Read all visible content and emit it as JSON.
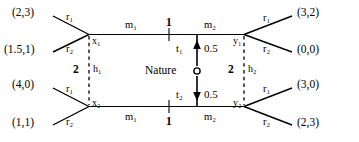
{
  "diagram": {
    "kind": "extensive-form-game-tree",
    "title": "",
    "nature_label": "Nature",
    "players": {
      "player1_label": "1",
      "player2_label": "2"
    },
    "nodes": [
      {
        "id": "x1",
        "label": "x₁",
        "x": 90,
        "y": 39
      },
      {
        "id": "x2",
        "label": "x₂",
        "x": 90,
        "y": 101
      },
      {
        "id": "y1",
        "label": "y₁",
        "x": 243,
        "y": 39
      },
      {
        "id": "y2",
        "label": "y₂",
        "x": 243,
        "y": 101
      },
      {
        "id": "nature",
        "label": "Nature",
        "x": 197,
        "y": 71
      }
    ],
    "information_sets": [
      {
        "id": "h1",
        "label": "h₁",
        "player": "2"
      },
      {
        "id": "h2",
        "label": "h₂",
        "player": "2"
      }
    ],
    "moves": {
      "m1_top": "m₁",
      "m2_top": "m₂",
      "m1_bottom": "m₁",
      "m2_bottom": "m₂",
      "t1": "t₁",
      "t2": "t₂",
      "r1": "r₁",
      "r2": "r₂"
    },
    "probabilities": {
      "t1": "0.5",
      "t2": "0.5"
    },
    "payoffs": {
      "top_left_r1": "(2,3)",
      "top_left_r2": "(1.5,1)",
      "bottom_left_r1": "(4,0)",
      "bottom_left_r2": "(1,1)",
      "top_right_r1": "(3,2)",
      "top_right_r2": "(0,0)",
      "bottom_right_r1": "(3,0)",
      "bottom_right_r2": "(2,3)"
    },
    "labels": {
      "top_mid_player": "1",
      "bottom_mid_player": "1",
      "left_info_player": "2",
      "right_info_player": "2"
    },
    "colors": {
      "line": "#000000",
      "text": "#000000",
      "background": "#ffffff"
    }
  }
}
